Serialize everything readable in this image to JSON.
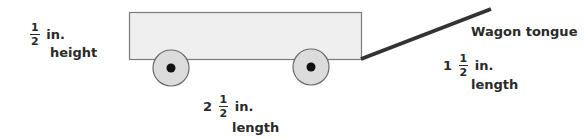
{
  "diagram": {
    "subject": "wagon",
    "colors": {
      "body_fill": "#efefef",
      "body_stroke": "#7a7a7a",
      "wheel_fill": "#dcdcdc",
      "wheel_stroke": "#6a6a6a",
      "hub_fill": "#111111",
      "tongue": "#333333",
      "text": "#2a2a2a"
    }
  },
  "labels": {
    "height": {
      "whole": "",
      "num": "1",
      "den": "2",
      "unit": "in.",
      "caption": "height"
    },
    "body_length": {
      "whole": "2",
      "num": "1",
      "den": "2",
      "unit": "in.",
      "caption": "length"
    },
    "tongue_title": "Wagon tongue",
    "tongue_length": {
      "whole": "1",
      "num": "1",
      "den": "2",
      "unit": "in.",
      "caption": "length"
    }
  }
}
